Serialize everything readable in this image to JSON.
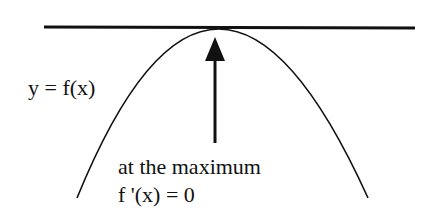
{
  "diagram": {
    "curve_label": "y = f(x)",
    "annotation_line1": "at the maximum",
    "annotation_line2": "f '(x) = 0",
    "elements": {
      "tangent_line": "horizontal tangent line at maximum",
      "curve": "downward parabola",
      "arrow": "up arrow pointing to maximum"
    },
    "colors": {
      "stroke": "#111111",
      "background": "#ffffff"
    }
  }
}
